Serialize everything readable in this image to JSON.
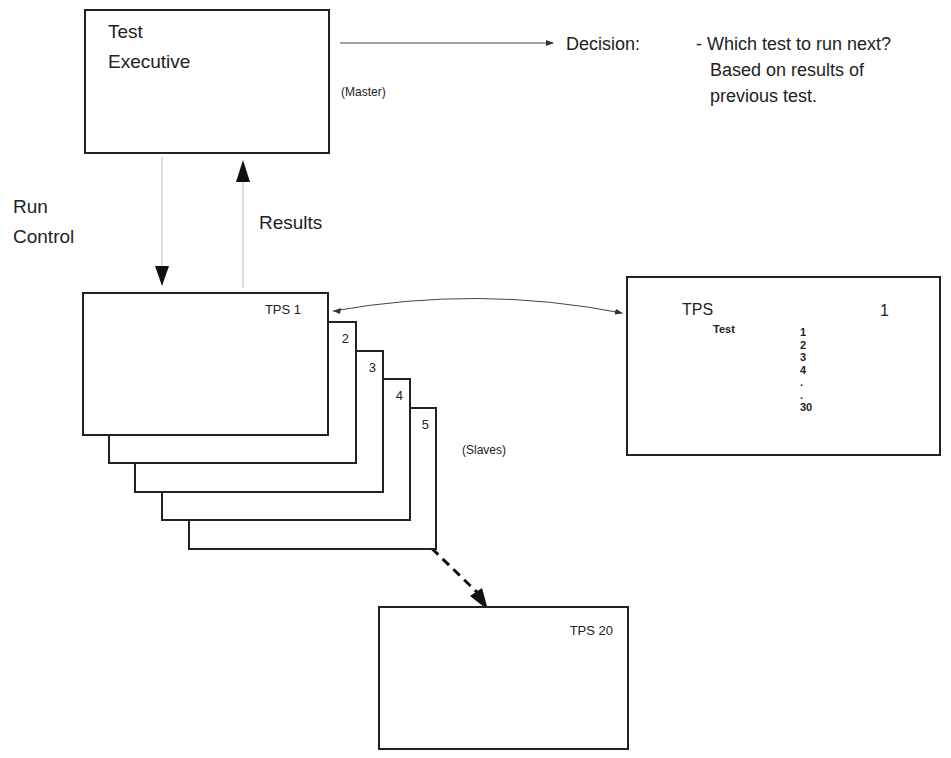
{
  "master": {
    "title_line1": "Test",
    "title_line2": "Executive",
    "role_label": "(Master)"
  },
  "decision": {
    "label": "Decision:",
    "lines": [
      "- Which test to run next?",
      "Based on results of",
      "previous test."
    ]
  },
  "flows": {
    "run_control_line1": "Run",
    "run_control_line2": "Control",
    "results": "Results"
  },
  "slaves": {
    "stack_labels": [
      "TPS 1",
      "2",
      "3",
      "4",
      "5"
    ],
    "role_label": "(Slaves)",
    "last_label": "TPS 20"
  },
  "detail": {
    "title": "TPS",
    "number": "1",
    "test_label": "Test",
    "tests": [
      "1",
      "2",
      "3",
      "4",
      ".",
      ".",
      "30"
    ]
  }
}
